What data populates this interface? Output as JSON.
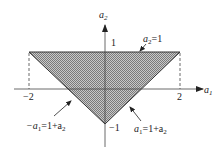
{
  "diagram": {
    "type": "feasible-region",
    "axes": {
      "x_label": "a",
      "x_label_sub": "1",
      "y_label": "a",
      "y_label_sub": "2"
    },
    "ticks": {
      "x_neg": "−2",
      "x_pos": "2",
      "y_pos": "1",
      "y_neg": "−1"
    },
    "region": {
      "vertices": [
        [
          -2,
          1
        ],
        [
          2,
          1
        ],
        [
          0,
          -1
        ]
      ],
      "fill": "#a8a8a8",
      "stroke": "#333333"
    },
    "annotations": {
      "top": {
        "lhs": "a",
        "lhs_sub": "2",
        "rhs": "=1"
      },
      "left": {
        "lhs": "−a",
        "lhs_sub": "1",
        "mid": "=1+a",
        "mid_sub": "2"
      },
      "right": {
        "lhs": "a",
        "lhs_sub": "1",
        "mid": "=1+a",
        "mid_sub": "2"
      }
    }
  }
}
